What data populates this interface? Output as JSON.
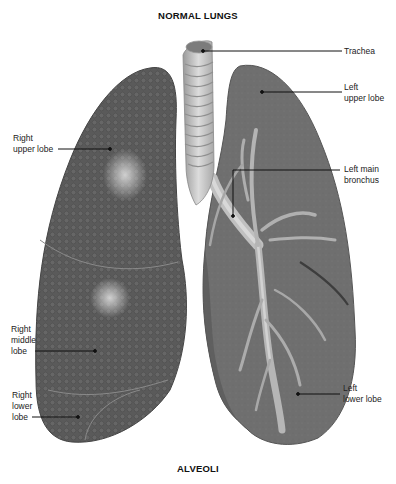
{
  "diagram": {
    "title": "NORMAL LUNGS",
    "caption": "ALVEOLI",
    "colors": {
      "right_lung": "#5c5c5c",
      "left_lung": "#6e6e6e",
      "trachea": "#c4c4c4",
      "bronchi": "#b8b8b8",
      "background": "#ffffff",
      "leader_line": "#111111"
    },
    "labels": {
      "trachea": "Trachea",
      "left_upper_lobe": "Left\nupper lobe",
      "left_main_bronchus": "Left main\nbronchus",
      "left_lower_lobe": "Left\nlower lobe",
      "right_upper_lobe": "Right\nupper lobe",
      "right_middle_lobe": "Right\nmiddle\nlobe",
      "right_lower_lobe": "Right\nlower\nlobe"
    }
  }
}
